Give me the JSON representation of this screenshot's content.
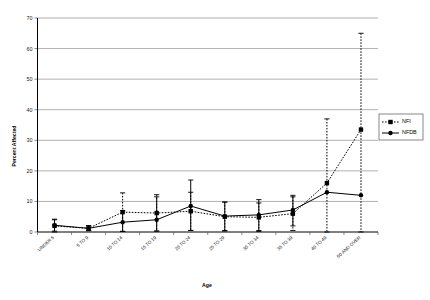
{
  "chart_data": {
    "type": "line",
    "title": "",
    "xlabel": "Age",
    "ylabel": "Percent Affected",
    "ylim": [
      0,
      70
    ],
    "yticks": [
      0,
      10,
      20,
      30,
      40,
      50,
      60,
      70
    ],
    "grid": true,
    "legend_position": "right",
    "categories": [
      "UNDER 5",
      "5 TO 9",
      "10 TO 14",
      "15 TO 19",
      "20 TO 24",
      "25 TO 29",
      "30 TO 34",
      "35 TO 39",
      "40 TO 49",
      "50 AND OVER"
    ],
    "series": [
      {
        "name": "NFI",
        "marker": "square",
        "linestyle": "dotted",
        "values": [
          2.0,
          1.2,
          6.5,
          6.2,
          6.8,
          5.0,
          4.8,
          6.0,
          16.0,
          33.5
        ],
        "error_upper": [
          4.0,
          2.0,
          12.8,
          12.2,
          13.0,
          9.8,
          9.5,
          11.5,
          37.0,
          65.0
        ],
        "error_lower": [
          0.0,
          0.5,
          0.2,
          0.3,
          0.5,
          0.3,
          0.2,
          0.5,
          0.0,
          0.0
        ]
      },
      {
        "name": "NFDB",
        "marker": "circle",
        "linestyle": "solid",
        "values": [
          2.2,
          1.2,
          3.2,
          4.0,
          8.5,
          5.2,
          5.6,
          7.2,
          13.0,
          12.0
        ],
        "error_upper": [
          4.2,
          2.1,
          7.0,
          11.5,
          17.0,
          9.8,
          10.6,
          12.0,
          13.0,
          12.0
        ],
        "error_lower": [
          0.3,
          0.4,
          0.2,
          0.3,
          0.5,
          0.5,
          0.5,
          2.0,
          13.0,
          12.0
        ]
      }
    ]
  },
  "legend": {
    "entries": [
      {
        "label": "NFI"
      },
      {
        "label": "NFDB"
      }
    ]
  },
  "axes": {
    "y_title": "Percent Affected",
    "x_title": "Age",
    "y_tick_labels": [
      "0",
      "10",
      "20",
      "30",
      "40",
      "50",
      "60",
      "70"
    ],
    "x_tick_labels": [
      "UNDER 5",
      "5 TO 9",
      "10 TO 14",
      "15 TO 19",
      "20 TO 24",
      "25 TO 29",
      "30 TO 34",
      "35 TO 39",
      "40 TO 49",
      "50 AND OVER"
    ]
  }
}
